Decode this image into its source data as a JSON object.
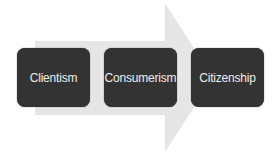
{
  "diagram": {
    "type": "process-arrow",
    "arrow_color": "#e6e6e6",
    "box_color": "#333333",
    "text_color": "#eeeeee",
    "steps": [
      {
        "label": "Clientism"
      },
      {
        "label": "Consumerism"
      },
      {
        "label": "Citizenship"
      }
    ]
  }
}
